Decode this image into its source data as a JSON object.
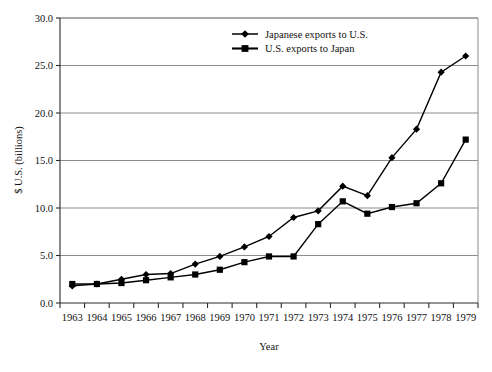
{
  "chart_data": {
    "type": "line",
    "title": "",
    "xlabel": "Year",
    "ylabel": "$ U.S. (billions)",
    "x": [
      1963,
      1964,
      1965,
      1966,
      1967,
      1968,
      1969,
      1970,
      1971,
      1972,
      1973,
      1974,
      1975,
      1976,
      1977,
      1978,
      1979
    ],
    "categories": [
      "1963",
      "1964",
      "1965",
      "1966",
      "1967",
      "1968",
      "1969",
      "1970",
      "1971",
      "1972",
      "1973",
      "1974",
      "1975",
      "1976",
      "1977",
      "1978",
      "1979"
    ],
    "series": [
      {
        "name": "Japanese exports to U.S.",
        "marker": "diamond",
        "color": "#000000",
        "values": [
          1.8,
          2.0,
          2.5,
          3.0,
          3.1,
          4.1,
          4.9,
          5.9,
          7.0,
          9.0,
          9.7,
          12.3,
          11.3,
          15.3,
          18.3,
          24.3,
          26.0
        ]
      },
      {
        "name": "U.S. exports to Japan",
        "marker": "square",
        "color": "#000000",
        "values": [
          2.0,
          2.0,
          2.1,
          2.4,
          2.7,
          3.0,
          3.5,
          4.3,
          4.9,
          4.9,
          8.3,
          10.7,
          9.4,
          10.1,
          10.5,
          12.6,
          17.2
        ]
      }
    ],
    "yticks": [
      0.0,
      5.0,
      10.0,
      15.0,
      20.0,
      25.0,
      30.0
    ],
    "ytick_labels": [
      "0.0",
      "5.0",
      "10.0",
      "15.0",
      "20.0",
      "25.0",
      "30.0"
    ],
    "ylim": [
      0.0,
      30.0
    ],
    "xlim": [
      1962.5,
      1979.5
    ],
    "grid": "horizontal",
    "grid_color": "#8c8c8c",
    "legend_position": "top-center-right",
    "legend_entries": [
      "Japanese exports to U.S.",
      "U.S. exports to Japan"
    ]
  },
  "figure": {
    "caption": ""
  }
}
